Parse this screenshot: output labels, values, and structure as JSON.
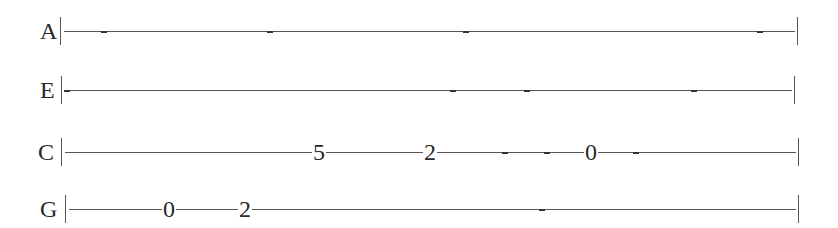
{
  "tablature": {
    "lines": [
      {
        "string": "A",
        "y": 31,
        "label_x": 40,
        "bar_start_x": 60,
        "bar_end_x": 797,
        "notes": [],
        "dashes": [
          104,
          270,
          466,
          760
        ]
      },
      {
        "string": "E",
        "y": 90,
        "label_x": 40,
        "bar_start_x": 61,
        "bar_end_x": 794,
        "notes": [],
        "dashes": [
          67,
          453,
          527,
          694
        ]
      },
      {
        "string": "C",
        "y": 152,
        "label_x": 38,
        "bar_start_x": 61,
        "bar_end_x": 798,
        "notes": [
          {
            "fret": "5",
            "x": 319
          },
          {
            "fret": "2",
            "x": 430
          },
          {
            "fret": "0",
            "x": 591
          }
        ],
        "dashes": [
          505,
          547,
          636
        ]
      },
      {
        "string": "G",
        "y": 209,
        "label_x": 40,
        "bar_start_x": 65,
        "bar_end_x": 798,
        "notes": [
          {
            "fret": "0",
            "x": 169
          },
          {
            "fret": "2",
            "x": 245
          }
        ],
        "dashes": [
          542
        ]
      }
    ]
  }
}
